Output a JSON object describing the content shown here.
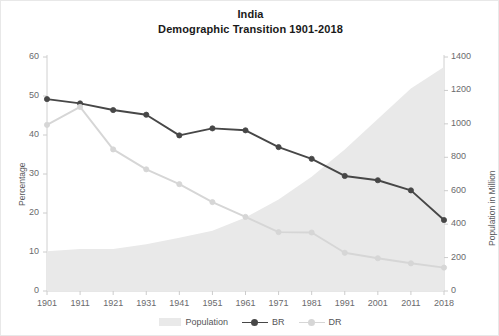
{
  "chart_data": {
    "type": "line",
    "title": "India",
    "subtitle": "Demographic Transition 1901-2018",
    "xlabel": "",
    "ylabel": "Percentage",
    "y2label": "Population in Million",
    "categories": [
      "1901",
      "1911",
      "1921",
      "1931",
      "1941",
      "1951",
      "1961",
      "1971",
      "1981",
      "1991",
      "2001",
      "2011",
      "2018"
    ],
    "ylim": [
      0,
      60
    ],
    "yticks": [
      0,
      10,
      20,
      30,
      40,
      50,
      60
    ],
    "y2lim": [
      0,
      1400
    ],
    "y2ticks": [
      0,
      200,
      400,
      600,
      800,
      1000,
      1200,
      1400
    ],
    "grid": false,
    "legend_position": "bottom",
    "series": [
      {
        "name": "Population",
        "type": "area",
        "axis": "right",
        "unit": "Million",
        "color": "#e9e9e9",
        "values": [
          238,
          252,
          251,
          279,
          319,
          361,
          439,
          548,
          683,
          846,
          1029,
          1211,
          1340
        ]
      },
      {
        "name": "BR",
        "type": "line",
        "axis": "left",
        "unit": "per 1000 / percentage",
        "color": "#474747",
        "values": [
          49.2,
          48.1,
          46.4,
          45.2,
          39.9,
          41.7,
          41.2,
          36.9,
          33.9,
          29.5,
          28.4,
          25.8,
          18.2
        ]
      },
      {
        "name": "DR",
        "type": "line",
        "axis": "left",
        "unit": "per 1000 / percentage",
        "color": "#d6d6d6",
        "values": [
          42.6,
          47.2,
          36.3,
          31.2,
          27.4,
          22.8,
          19.0,
          15.1,
          15.0,
          9.8,
          8.4,
          7.1,
          6.0
        ]
      }
    ]
  },
  "legend": {
    "items": [
      {
        "label": "Population",
        "marker": "area-swatch",
        "color": "#e9e9e9"
      },
      {
        "label": "BR",
        "marker": "line-marker",
        "color": "#474747"
      },
      {
        "label": "DR",
        "marker": "line-marker",
        "color": "#d6d6d6"
      }
    ]
  }
}
